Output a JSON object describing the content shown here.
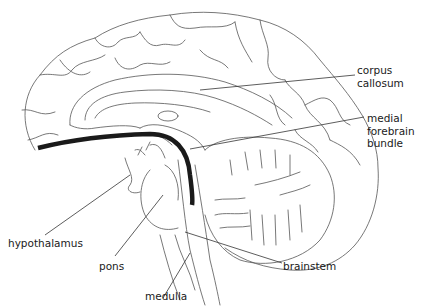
{
  "diagram": {
    "highlight": "medial forebrain bundle (thick black line)",
    "labels": {
      "corpus_callosum": "corpus\ncallosum",
      "medial_forebrain_bundle": "medial\nforebrain\nbundle",
      "hypothalamus": "hypothalamus",
      "pons": "pons",
      "brainstem": "brainstem",
      "medulla": "medulla"
    },
    "colors": {
      "outline": "#555555",
      "pathway": "#1a1a1a",
      "text": "#1a1a1a",
      "background": "#ffffff"
    }
  }
}
